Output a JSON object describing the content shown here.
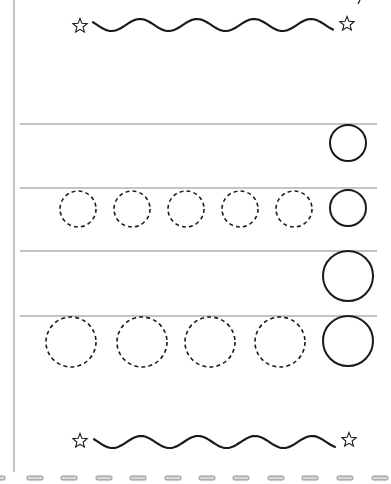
{
  "worksheet": {
    "title": "",
    "background": "#ffffff",
    "ink_color": "#1a1a1a",
    "rule_color": "#8a8a8a",
    "margin_line": {
      "x": 14,
      "y1": 0,
      "y2": 472,
      "color": "#9a9a9a"
    },
    "top_border": {
      "left_star": {
        "cx": 80,
        "cy": 26
      },
      "right_star": {
        "cx": 347,
        "cy": 24
      },
      "wave": {
        "x1": 93,
        "x2": 333,
        "cy": 25,
        "amplitude": 6,
        "period": 57
      }
    },
    "bottom_border": {
      "left_star": {
        "cx": 80,
        "cy": 441
      },
      "right_star": {
        "cx": 349,
        "cy": 440
      },
      "wave": {
        "x1": 94,
        "x2": 335,
        "cy": 442,
        "amplitude": 6,
        "period": 57
      }
    },
    "rules": [
      {
        "y": 124,
        "x1": 20,
        "x2": 377
      },
      {
        "y": 188,
        "x1": 20,
        "x2": 377
      },
      {
        "y": 251,
        "x1": 20,
        "x2": 377
      },
      {
        "y": 316,
        "x1": 20,
        "x2": 377
      }
    ],
    "rows": [
      {
        "name": "small-example-row",
        "solid_circles": [
          {
            "cx": 348,
            "cy": 143,
            "r": 18
          }
        ],
        "dashed_circles": []
      },
      {
        "name": "small-trace-row",
        "solid_circles": [
          {
            "cx": 348,
            "cy": 208,
            "r": 18
          }
        ],
        "dashed_circles": [
          {
            "cx": 78,
            "cy": 209,
            "r": 18
          },
          {
            "cx": 132,
            "cy": 209,
            "r": 18
          },
          {
            "cx": 186,
            "cy": 209,
            "r": 18
          },
          {
            "cx": 240,
            "cy": 209,
            "r": 18
          },
          {
            "cx": 294,
            "cy": 209,
            "r": 18
          }
        ]
      },
      {
        "name": "large-example-row",
        "solid_circles": [
          {
            "cx": 348,
            "cy": 276,
            "r": 25
          }
        ],
        "dashed_circles": []
      },
      {
        "name": "large-trace-row",
        "solid_circles": [
          {
            "cx": 348,
            "cy": 341,
            "r": 25
          }
        ],
        "dashed_circles": [
          {
            "cx": 71,
            "cy": 342,
            "r": 25
          },
          {
            "cx": 142,
            "cy": 342,
            "r": 25
          },
          {
            "cx": 210,
            "cy": 342,
            "r": 25
          },
          {
            "cx": 280,
            "cy": 342,
            "r": 25
          }
        ]
      }
    ],
    "cut_line": {
      "y": 478,
      "dash_width": 16,
      "dash_height": 4,
      "dash_x": [
        -11,
        27,
        61,
        96,
        130,
        165,
        199,
        233,
        268,
        302,
        337,
        372
      ],
      "fill": "#d6d6d6",
      "stroke": "#7a7a7a"
    },
    "corner_mark": {
      "x1": 360,
      "y1": 0,
      "x2": 358,
      "y2": 4
    }
  }
}
